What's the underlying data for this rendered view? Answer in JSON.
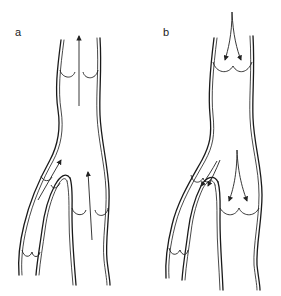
{
  "figure": {
    "panels": [
      {
        "id": "a",
        "label": "a",
        "description": "Vein with competent valves; blood flow arrows point upward (toward heart)",
        "flow_direction": "up"
      },
      {
        "id": "b",
        "label": "b",
        "description": "Vein with incompetent valves; blood flow arrows point downward (reflux)",
        "flow_direction": "down"
      }
    ],
    "colors": {
      "line": "#1a1a1a",
      "background": "#ffffff"
    }
  }
}
